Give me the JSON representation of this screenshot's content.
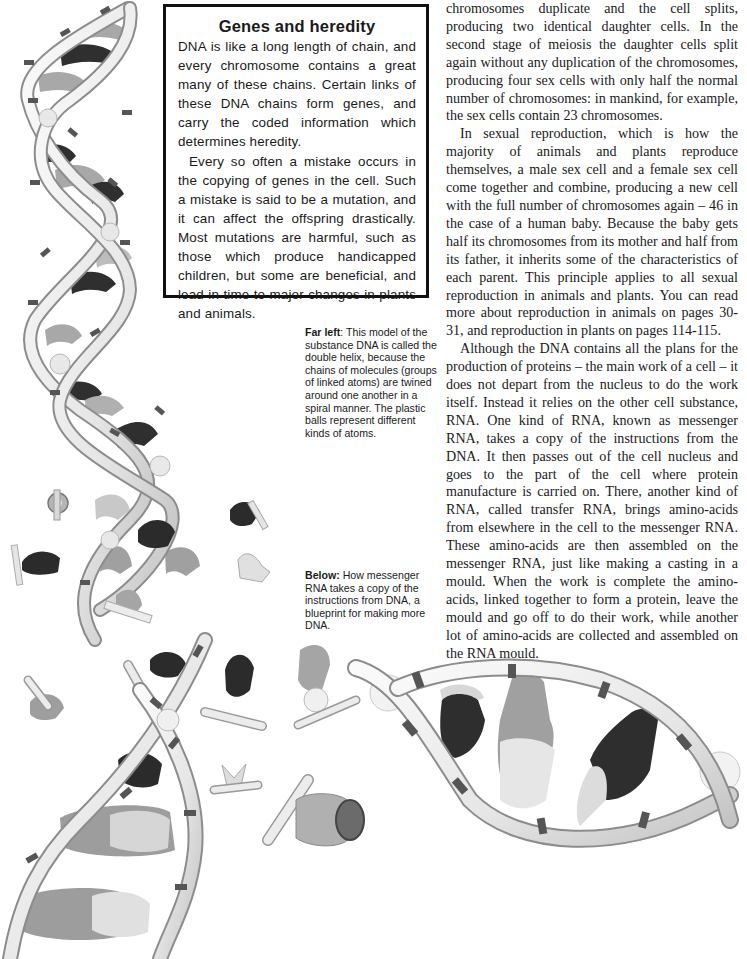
{
  "sidebar_box": {
    "title": "Genes and heredity",
    "paragraphs": [
      "DNA is like a long length of chain, and every chromosome contains a great many of these chains. Certain links of these DNA chains form genes, and carry the coded information which determines heredity.",
      "Every so often a mistake occurs in the copying of genes in the cell. Such a mistake is said to be a mutation, and it can affect the offspring drastically. Most mutations are harmful, such as those which produce handicapped children, but some are beneficial, and lead in time to major changes in plants and animals."
    ]
  },
  "captions": {
    "far_left": {
      "label": "Far left",
      "text": ": This model of the substance DNA is called the double helix, because the chains of molecules (groups of linked atoms) are twined around one another in a spiral manner. The plastic balls represent different kinds of atoms."
    },
    "below": {
      "label": "Below:",
      "text": " How messenger RNA takes a copy of the instructions from DNA, a blueprint for making more DNA."
    }
  },
  "body_column": {
    "paragraphs": [
      "chromosomes duplicate and the cell splits, producing two identical daughter cells. In the second stage of meiosis the daughter cells split again without any duplication of the chromosomes, producing four sex cells with only half the normal number of chromosomes: in mankind, for example, the sex cells contain 23 chromosomes.",
      "In sexual reproduction, which is how the majority of animals and plants reproduce themselves, a male sex cell and a female sex cell come together and combine, producing a new cell with the full number of chromosomes again – 46 in the case of a human baby. Because the baby gets half its chromosomes from its mother and half from its father, it inherits some of the characteristics of each parent. This principle applies to all sexual reproduction in animals and plants. You can read more about reproduction in animals on pages 30-31, and reproduction in plants on pages 114-115.",
      "Although the DNA contains all the plans for the production of proteins – the main work of a cell – it does not depart from the nucleus to do the work itself. Instead it relies on the other cell substance, RNA. One kind of RNA, known as messenger RNA, takes a copy of the instructions from the DNA. It then passes out of the cell nucleus and goes to the part of the cell where protein manufacture is carried on. There, another kind of RNA, called transfer RNA, brings amino-acids from elsewhere in the cell to the messenger RNA. These amino-acids are then assembled on the messenger RNA, just like making a casting in a mould. When the work is complete the amino-acids, linked together to form a protein, leave the mould and go off to do their work, while another lot of amino-acids are collected and assembled on the RNA mould."
    ]
  },
  "illustration": {
    "subject": "DNA double helix model unwinding into messenger RNA with loose amino-acid pieces",
    "colors": {
      "strand": "#ececec",
      "strand_edge": "#9a9a9a",
      "band": "#555555",
      "base_dark": "#2f2f2f",
      "base_mid": "#9c9c9c",
      "base_light": "#d9d9d9"
    }
  }
}
